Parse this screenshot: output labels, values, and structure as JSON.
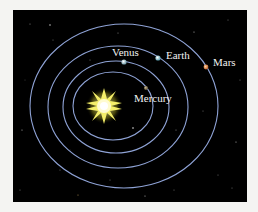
{
  "diagram": {
    "background_color": "#000000",
    "page_color": "#f4f4f2",
    "orbit_color": "#8fa3d6",
    "sun": {
      "name": "Sun",
      "cx": 104,
      "cy": 106,
      "color": "#fff7a0",
      "glow": "#e8e030"
    },
    "orbits": [
      {
        "planet": "Mercury",
        "cx": 113,
        "cy": 106,
        "rx": 40,
        "ry": 34
      },
      {
        "planet": "Venus",
        "cx": 116,
        "cy": 107,
        "rx": 53,
        "ry": 46
      },
      {
        "planet": "Earth",
        "cx": 118,
        "cy": 107,
        "rx": 70,
        "ry": 61
      },
      {
        "planet": "Mars",
        "cx": 124,
        "cy": 106,
        "rx": 94,
        "ry": 82
      }
    ],
    "planets": [
      {
        "name": "Mercury",
        "label": "Mercury",
        "x": 146,
        "y": 88,
        "r": 2,
        "color": "#8a7a5a",
        "label_x": 134,
        "label_y": 102
      },
      {
        "name": "Venus",
        "label": "Venus",
        "x": 124,
        "y": 62,
        "r": 2.6,
        "color": "#9fc0c8",
        "label_x": 112,
        "label_y": 56
      },
      {
        "name": "Earth",
        "label": "Earth",
        "x": 158,
        "y": 58,
        "r": 2.6,
        "color": "#9cc6d0",
        "label_x": 166,
        "label_y": 59
      },
      {
        "name": "Mars",
        "label": "Mars",
        "x": 206,
        "y": 67,
        "r": 2.4,
        "color": "#e08a4a",
        "label_x": 213,
        "label_y": 66
      }
    ]
  }
}
